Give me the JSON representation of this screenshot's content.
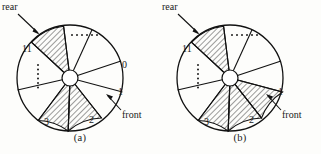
{
  "figure": {
    "type": "two-panel-sector-wheel-diagram",
    "panels": [
      {
        "id": "a",
        "caption": "(a)",
        "labels": {
          "rear": "rear",
          "eleven": "11",
          "zero": "0",
          "one": "1",
          "front": "front",
          "three": "3",
          "two": "2"
        },
        "ellipsis_horizontal": "......",
        "ellipsis_vertical": "......",
        "hatched_sectors": [
          "11",
          "3",
          "2"
        ],
        "sector_count": 12,
        "hub": "center-hub-circle"
      },
      {
        "id": "b",
        "caption": "(b)",
        "labels": {
          "rear": "rear",
          "eleven": "11",
          "zero": "",
          "one": "1",
          "front": "front",
          "three": "3",
          "two": "2"
        },
        "ellipsis_horizontal": "......",
        "ellipsis_vertical": "......",
        "hatched_sectors": [
          "11",
          "3",
          "2",
          "1"
        ],
        "sector_count": 12,
        "hub": "center-hub-circle"
      }
    ],
    "colors": {
      "stroke": "#111111",
      "hatch": "#222222",
      "background": "#fdfdfb",
      "fill": "#ffffff"
    }
  }
}
